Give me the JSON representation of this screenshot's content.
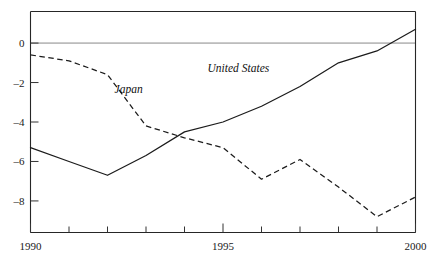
{
  "chart_data": {
    "type": "line",
    "title": "",
    "subtitle": "",
    "xlabel": "",
    "ylabel": "",
    "xlim": [
      1990,
      2000
    ],
    "ylim": [
      -9.6,
      1.6
    ],
    "grid": false,
    "zero_line": true,
    "legend": "inline-annotations",
    "x": [
      1990,
      1991,
      1992,
      1993,
      1994,
      1995,
      1996,
      1997,
      1998,
      1999,
      2000
    ],
    "x_tick_values": [
      1990,
      1991,
      1992,
      1993,
      1994,
      1995,
      1996,
      1997,
      1998,
      1999,
      2000
    ],
    "x_tick_labels": [
      "1990",
      "",
      "",
      "",
      "",
      "1995",
      "",
      "",
      "",
      "",
      "2000"
    ],
    "y_tick_values": [
      0,
      -2,
      -4,
      -6,
      -8
    ],
    "y_tick_labels": [
      "0",
      "–2",
      "–4",
      "–6",
      "–8"
    ],
    "series": [
      {
        "name": "United States",
        "style": "solid",
        "label": "United States",
        "values": [
          -5.3,
          -6.0,
          -6.7,
          -5.7,
          -4.5,
          -4.0,
          -3.2,
          -2.2,
          -1.0,
          -0.4,
          0.7
        ]
      },
      {
        "name": "Japan",
        "style": "dashed",
        "label": "Japan",
        "values": [
          -0.6,
          -0.9,
          -1.6,
          -4.2,
          -4.8,
          -5.3,
          -6.9,
          -5.9,
          -7.3,
          -8.8,
          -7.8
        ]
      }
    ],
    "annotations": [
      {
        "text": "Japan",
        "x": 1992.55,
        "y": -2.55
      },
      {
        "text": "United States",
        "x": 1995.4,
        "y": -1.45
      }
    ],
    "colors": {
      "line": "#1b1b1b",
      "axis": "#262626",
      "zero_line": "#7a7a7a",
      "background": "#ffffff",
      "text": "#1a1a1a"
    }
  }
}
